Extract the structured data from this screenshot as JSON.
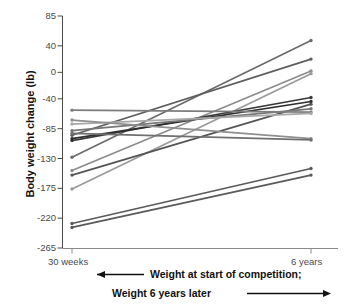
{
  "chart_data": {
    "type": "line",
    "subtype": "slopegraph",
    "title": "",
    "xlabel": "",
    "ylabel": "Body weight change (lb)",
    "categories": [
      "30 weeks",
      "6 years"
    ],
    "x": [
      0,
      1
    ],
    "ylim": [
      -265,
      85
    ],
    "yticks": [
      85,
      40,
      0,
      -40,
      -85,
      -130,
      -175,
      -220,
      -265
    ],
    "ytick_labels": [
      "85",
      "40",
      "0",
      "-40",
      "-85",
      "-130",
      "-175",
      "-220",
      "-265"
    ],
    "xtick_labels": [
      "30 weeks",
      "6 years"
    ],
    "grid": false,
    "legend": "none",
    "units": "lb",
    "n_series": 14,
    "series": [
      {
        "name": "participant-1",
        "values": [
          -128,
          48
        ],
        "color": "#6b6b6b"
      },
      {
        "name": "participant-2",
        "values": [
          -95,
          20
        ],
        "color": "#5e5e5e"
      },
      {
        "name": "participant-3",
        "values": [
          -148,
          2
        ],
        "color": "#8c8c8c"
      },
      {
        "name": "participant-4",
        "values": [
          -176,
          -2
        ],
        "color": "#9a9a9a"
      },
      {
        "name": "participant-5",
        "values": [
          -103,
          -38
        ],
        "color": "#3a3a3a"
      },
      {
        "name": "participant-6",
        "values": [
          -100,
          -44
        ],
        "color": "#2e2e2e"
      },
      {
        "name": "participant-7",
        "values": [
          -155,
          -48
        ],
        "color": "#555555"
      },
      {
        "name": "participant-8",
        "values": [
          -88,
          -55
        ],
        "color": "#767676"
      },
      {
        "name": "participant-9",
        "values": [
          -57,
          -60
        ],
        "color": "#7d7d7d"
      },
      {
        "name": "participant-10",
        "values": [
          -78,
          -62
        ],
        "color": "#a8a8a8"
      },
      {
        "name": "participant-11",
        "values": [
          -72,
          -100
        ],
        "color": "#8f8f8f"
      },
      {
        "name": "participant-12",
        "values": [
          -92,
          -102
        ],
        "color": "#6f6f6f"
      },
      {
        "name": "participant-13",
        "values": [
          -228,
          -145
        ],
        "color": "#5a5a5a"
      },
      {
        "name": "participant-14",
        "values": [
          -234,
          -155
        ],
        "color": "#5a5a5a"
      }
    ],
    "annotations": [
      {
        "id": "caption-line-1",
        "text": "Weight at start of competition;",
        "arrow": "left"
      },
      {
        "id": "caption-line-2",
        "text": "Weight 6 years later",
        "arrow": "right"
      }
    ]
  },
  "axis": {
    "y_title": "Body weight change (lb)"
  },
  "caption": {
    "line1": "Weight at start of competition;",
    "line2": "Weight 6 years later"
  }
}
